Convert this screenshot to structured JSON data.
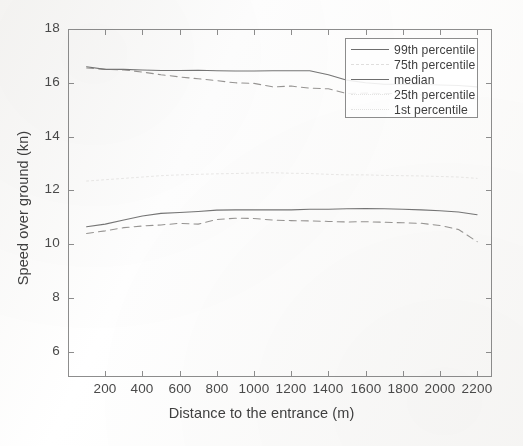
{
  "figure": {
    "title": "",
    "background_color": "#ffffff",
    "line_color": "#6e6e6e",
    "axis_color": "#8d8d8d",
    "text_color": "#3f3f3f"
  },
  "axes": {
    "x_title": "Distance to the entrance (m)",
    "y_title": "Speed over ground (kn)",
    "x_ticks": [
      "200",
      "400",
      "600",
      "800",
      "1000",
      "1200",
      "1400",
      "1600",
      "1800",
      "2000",
      "2200"
    ],
    "y_ticks": [
      "18",
      "16",
      "14",
      "12",
      "10",
      "8",
      "6"
    ]
  },
  "legend": {
    "entries": [
      {
        "label": "99th percentile",
        "style": "solid"
      },
      {
        "label": "75th percentile",
        "style": "dashed"
      },
      {
        "label": "median",
        "style": "solid"
      },
      {
        "label": "25th percentile",
        "style": "dashed"
      },
      {
        "label": "1st percentile",
        "style": "dotted"
      }
    ]
  },
  "chart_data": {
    "type": "line",
    "title": "",
    "xlabel": "Distance to the entrance (m)",
    "ylabel": "Speed over ground (kn)",
    "xlim": [
      0,
      2280
    ],
    "ylim": [
      5.07,
      18
    ],
    "x_tick_values": [
      200,
      400,
      600,
      800,
      1000,
      1200,
      1400,
      1600,
      1800,
      2000,
      2200
    ],
    "y_tick_values": [
      6,
      8,
      10,
      12,
      14,
      16,
      18
    ],
    "grid": false,
    "legend_position": "top-right",
    "x": [
      100,
      200,
      300,
      400,
      500,
      600,
      700,
      800,
      900,
      1000,
      1100,
      1200,
      1300,
      1400,
      1500,
      1600,
      1700,
      1800,
      1900,
      2000,
      2100,
      2200
    ],
    "series": [
      {
        "name": "99th percentile",
        "style": "solid",
        "values": [
          16.6,
          16.5,
          16.5,
          16.48,
          16.46,
          16.46,
          16.47,
          16.45,
          16.44,
          16.44,
          16.45,
          16.45,
          16.45,
          16.3,
          16.1,
          16.0,
          15.95,
          15.95,
          15.95,
          15.92,
          15.9,
          15.85
        ]
      },
      {
        "name": "75th percentile",
        "style": "dashed",
        "values": [
          16.55,
          16.5,
          16.48,
          16.4,
          16.3,
          16.22,
          16.15,
          16.08,
          16.0,
          15.98,
          15.85,
          15.88,
          15.8,
          15.78,
          15.6,
          15.62,
          15.6,
          15.6,
          15.55,
          15.5,
          15.45,
          15.4
        ]
      },
      {
        "name": "median",
        "style": "solid",
        "values": [
          10.65,
          10.75,
          10.9,
          11.05,
          11.15,
          11.18,
          11.22,
          11.27,
          11.28,
          11.28,
          11.28,
          11.28,
          11.3,
          11.3,
          11.32,
          11.33,
          11.32,
          11.3,
          11.28,
          11.25,
          11.2,
          11.1
        ]
      },
      {
        "name": "25th percentile",
        "style": "dashed",
        "values": [
          10.4,
          10.5,
          10.62,
          10.68,
          10.72,
          10.78,
          10.75,
          10.92,
          10.97,
          10.96,
          10.9,
          10.88,
          10.87,
          10.85,
          10.83,
          10.84,
          10.82,
          10.8,
          10.78,
          10.7,
          10.55,
          10.1
        ]
      },
      {
        "name": "1st percentile",
        "style": "dotted",
        "values": [
          12.35,
          12.4,
          12.45,
          12.5,
          12.55,
          12.58,
          12.6,
          12.62,
          12.63,
          12.65,
          12.66,
          12.64,
          12.63,
          12.6,
          12.58,
          12.58,
          12.56,
          12.55,
          12.54,
          12.52,
          12.5,
          12.45
        ]
      }
    ]
  }
}
